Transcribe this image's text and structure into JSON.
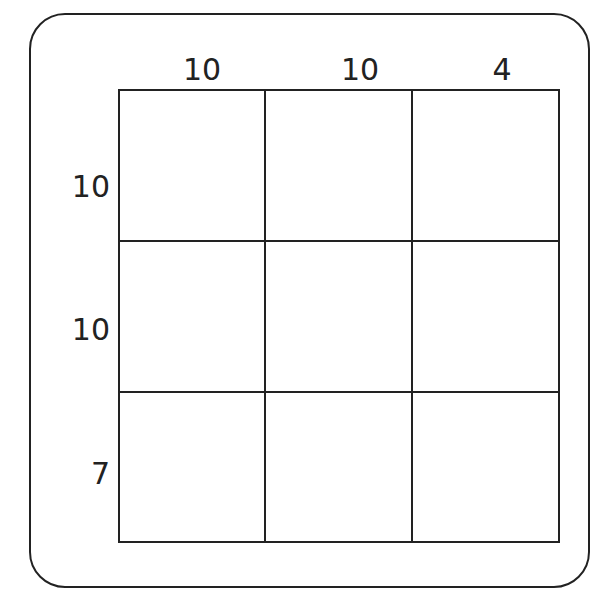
{
  "puzzle": {
    "column_sums": [
      "10",
      "10",
      "4"
    ],
    "row_sums": [
      "10",
      "10",
      "7"
    ],
    "cells": [
      [
        "",
        "",
        ""
      ],
      [
        "",
        "",
        ""
      ],
      [
        "",
        "",
        ""
      ]
    ]
  },
  "colors": {
    "line": "#222222",
    "background": "#ffffff"
  }
}
